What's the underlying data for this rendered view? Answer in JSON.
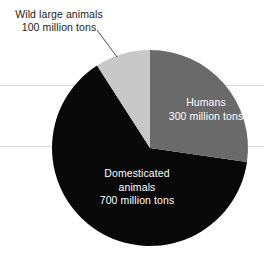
{
  "chart_data": {
    "type": "pie",
    "title": "",
    "subtitle": "",
    "unit": "million tons",
    "total": 1100,
    "legend_position": "inline-labels",
    "grid": false,
    "categories": [
      "Humans",
      "Domesticated animals",
      "Wild large animals"
    ],
    "values": [
      300,
      700,
      100
    ],
    "slices": [
      {
        "name": "Humans",
        "label_line_1": "Humans",
        "label_line_2": "300 million tons",
        "value": 300,
        "unit": "million tons",
        "percent": 27.3,
        "start_angle_deg": 0,
        "sweep_deg": 98.2,
        "color": "#6a6a6a",
        "label_color": "#ffffff",
        "label_placement": "inside"
      },
      {
        "name": "Domesticated animals",
        "label_line_1": "Domesticated",
        "label_line_2": "animals",
        "label_line_3": "700 million tons",
        "value": 700,
        "unit": "million tons",
        "percent": 63.6,
        "start_angle_deg": 98.2,
        "sweep_deg": 229.1,
        "color": "#080808",
        "label_color": "#ffffff",
        "label_placement": "inside"
      },
      {
        "name": "Wild large animals",
        "label_line_1": "Wild large animals",
        "label_line_2": "100 million tons",
        "value": 100,
        "unit": "million tons",
        "percent": 9.1,
        "start_angle_deg": 327.3,
        "sweep_deg": 32.7,
        "color": "#c8c8c8",
        "label_color": "#1b1b1b",
        "label_placement": "callout"
      }
    ],
    "colors": {
      "humans": "#6a6a6a",
      "domesticated_animals": "#080808",
      "wild_large_animals": "#c8c8c8",
      "background": "#ffffff",
      "callout_text": "#1b1b1b",
      "leader_line": "#3a3a3a"
    },
    "geometry": {
      "center_x": 150,
      "center_y": 148,
      "radius": 98
    }
  }
}
